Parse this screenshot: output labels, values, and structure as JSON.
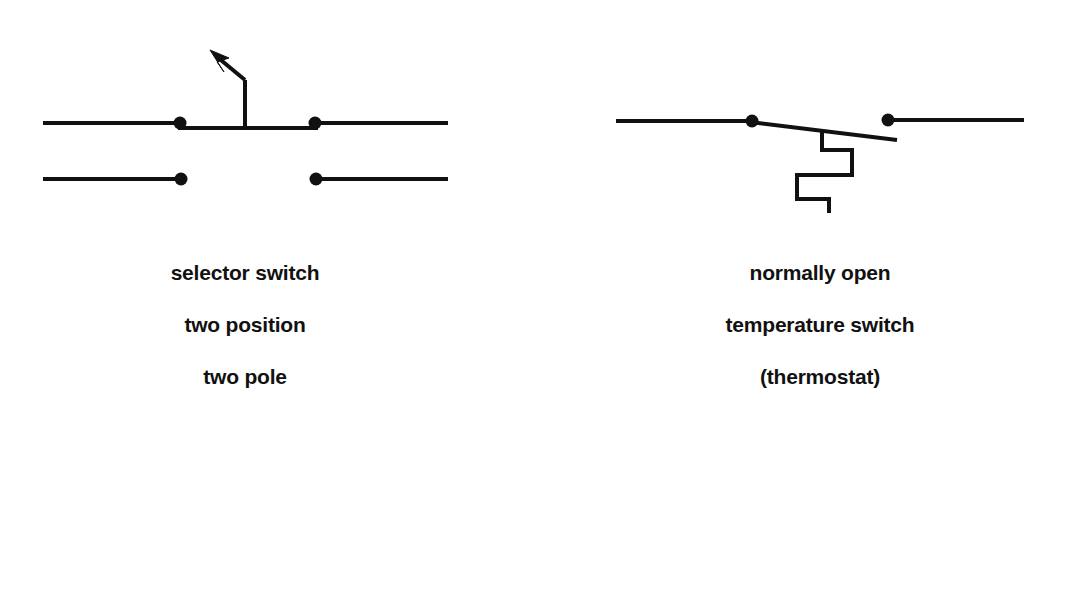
{
  "page": {
    "background_color": "#ffffff",
    "stroke_color": "#111111",
    "width": 1072,
    "height": 593
  },
  "figures": [
    {
      "id": "selector-switch",
      "symbol_name": "selector-switch-two-position-two-pole",
      "caption_lines": [
        "selector switch",
        "two position",
        "two pole"
      ],
      "elements": {
        "upper_pole_left_wire": "horizontal line",
        "upper_pole_right_wire": "horizontal line",
        "upper_contact_dots": 2,
        "closed_blade": "bridging bar between upper contacts",
        "actuator_stem": "vertical line",
        "actuator_arrow": "arrowhead pointing up-left",
        "lower_pole_left_wire": "horizontal line",
        "lower_pole_right_wire": "horizontal line",
        "lower_contact_dots": 2,
        "lower_pole_state": "open"
      }
    },
    {
      "id": "thermostat",
      "symbol_name": "normally-open-temperature-switch",
      "caption_lines": [
        "normally open",
        "temperature switch",
        "(thermostat)"
      ],
      "elements": {
        "left_wire": "horizontal line",
        "right_wire": "horizontal line",
        "pivot_dot": 1,
        "terminal_dot": 1,
        "switch_blade": "slanted open blade",
        "bimetallic_strip": "zigzag line below blade",
        "contact_state": "normally open"
      }
    }
  ],
  "captions": {
    "selector_switch": {
      "line1": "selector switch",
      "line2": "two position",
      "line3": "two pole"
    },
    "thermostat": {
      "line1": "normally open",
      "line2": "temperature switch",
      "line3": "(thermostat)"
    }
  }
}
